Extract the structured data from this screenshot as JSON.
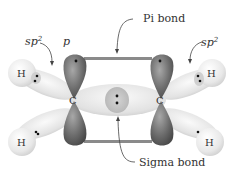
{
  "diagram": {
    "labels": {
      "sp2_left": "sp",
      "sp2_left_sup": "2",
      "p": "p",
      "pi_bond": "Pi bond",
      "sp2_right": "sp",
      "sp2_right_sup": "2",
      "sigma_bond": "Sigma bond"
    },
    "atoms": {
      "carbon_left": "C",
      "carbon_right": "C",
      "h_top_left": "H",
      "h_bottom_left": "H",
      "h_top_right": "H",
      "h_bottom_right": "H"
    },
    "colors": {
      "p_orbital": "#6e6e6e",
      "p_orbital_light": "#9a9a9a",
      "sp2_orbital": "#dedede",
      "h_sphere": "#ececec",
      "pi_line": "#8a8a8a",
      "sigma_core": "#c8c8c8",
      "text": "#333333"
    }
  }
}
